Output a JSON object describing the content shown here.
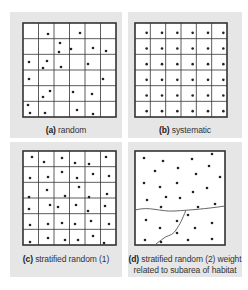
{
  "colors": {
    "panel_bg": "#e6e6e6",
    "grid_line": "#333333",
    "dot": "#222222",
    "boundary": "#555555"
  },
  "panels": [
    {
      "id": "a",
      "letter": "(a)",
      "caption": " random",
      "grid": {
        "x": 23,
        "y": 23,
        "w": 93,
        "h": 94,
        "cols": 6,
        "rows": 6
      },
      "dots": [
        [
          48,
          34
        ],
        [
          80,
          33
        ],
        [
          60,
          43
        ],
        [
          59,
          52
        ],
        [
          71,
          49
        ],
        [
          93,
          48
        ],
        [
          106,
          51
        ],
        [
          29,
          62
        ],
        [
          47,
          61
        ],
        [
          43,
          68
        ],
        [
          61,
          67
        ],
        [
          88,
          64
        ],
        [
          29,
          79
        ],
        [
          103,
          79
        ],
        [
          50,
          91
        ],
        [
          43,
          97
        ],
        [
          73,
          92
        ],
        [
          92,
          94
        ],
        [
          28,
          105
        ],
        [
          30,
          113
        ],
        [
          45,
          113
        ],
        [
          77,
          110
        ],
        [
          93,
          114
        ]
      ]
    },
    {
      "id": "b",
      "letter": "(b)",
      "caption": " systematic",
      "grid": {
        "x": 135,
        "y": 23,
        "w": 92,
        "h": 94,
        "cols": 6,
        "rows": 6
      },
      "dots": "systematic"
    },
    {
      "id": "c",
      "letter": "(c)",
      "caption": " stratified random (1)",
      "grid": {
        "x": 23,
        "y": 151,
        "w": 93,
        "h": 94,
        "cols": 6,
        "rows": 6
      },
      "dots": [
        [
          32,
          157
        ],
        [
          44,
          162
        ],
        [
          62,
          158
        ],
        [
          75,
          163
        ],
        [
          89,
          164
        ],
        [
          106,
          157
        ],
        [
          30,
          178
        ],
        [
          48,
          177
        ],
        [
          62,
          172
        ],
        [
          77,
          178
        ],
        [
          93,
          174
        ],
        [
          109,
          176
        ],
        [
          47,
          190
        ],
        [
          79,
          187
        ],
        [
          29,
          197
        ],
        [
          65,
          196
        ],
        [
          89,
          197
        ],
        [
          107,
          194
        ],
        [
          29,
          209
        ],
        [
          50,
          205
        ],
        [
          58,
          207
        ],
        [
          76,
          205
        ],
        [
          88,
          211
        ],
        [
          105,
          206
        ],
        [
          30,
          225
        ],
        [
          48,
          224
        ],
        [
          62,
          223
        ],
        [
          75,
          224
        ],
        [
          91,
          221
        ],
        [
          109,
          224
        ],
        [
          30,
          242
        ],
        [
          48,
          238
        ],
        [
          65,
          240
        ],
        [
          78,
          240
        ],
        [
          93,
          236
        ],
        [
          104,
          243
        ]
      ]
    },
    {
      "id": "d",
      "letter": "(d)",
      "caption": " stratified random (2) weight",
      "caption_line2": "related to subarea of habitat",
      "grid": {
        "x": 135,
        "y": 151,
        "w": 90,
        "h": 94
      },
      "dots": [
        [
          144,
          158
        ],
        [
          163,
          161
        ],
        [
          192,
          159
        ],
        [
          212,
          154
        ],
        [
          155,
          171
        ],
        [
          178,
          168
        ],
        [
          196,
          174
        ],
        [
          209,
          166
        ],
        [
          144,
          183
        ],
        [
          160,
          187
        ],
        [
          177,
          183
        ],
        [
          193,
          192
        ],
        [
          220,
          177
        ],
        [
          207,
          188
        ],
        [
          147,
          200
        ],
        [
          166,
          197
        ],
        [
          180,
          198
        ],
        [
          198,
          207
        ],
        [
          215,
          204
        ],
        [
          161,
          207
        ],
        [
          146,
          220
        ],
        [
          177,
          221
        ],
        [
          188,
          215
        ],
        [
          160,
          228
        ],
        [
          195,
          228
        ],
        [
          212,
          223
        ],
        [
          177,
          233
        ],
        [
          145,
          240
        ],
        [
          161,
          242
        ],
        [
          188,
          240
        ],
        [
          212,
          239
        ]
      ]
    }
  ]
}
